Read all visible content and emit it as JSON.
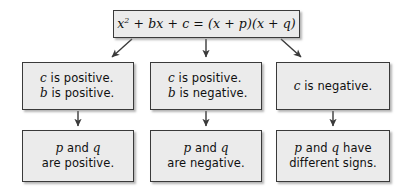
{
  "diagram": {
    "background_color": "#ffffff",
    "box_fill": "#ebebeb",
    "box_border_color": "#3a3a3a",
    "text_color": "#101010",
    "connector_color": "#3a3a3a"
  },
  "equation": {
    "lhs_x": "x",
    "lhs_exponent": "2",
    "lhs_rest": " + bx + c = (x + p)(x + q)",
    "full_text": "x2 + bx + c = (x + p)(x + q)"
  },
  "conditions": [
    {
      "id": "left",
      "line1_var": "c",
      "line1_text": " is positive.",
      "line2_var": "b",
      "line2_text": " is positive.",
      "full_text": "c is positive. b is positive."
    },
    {
      "id": "middle",
      "line1_var": "c",
      "line1_text": " is positive.",
      "line2_var": "b",
      "line2_text": " is negative.",
      "full_text": "c is positive. b is negative."
    },
    {
      "id": "right",
      "line1_var": "c",
      "line1_text": " is negative.",
      "full_text": "c is negative."
    }
  ],
  "conclusions": [
    {
      "id": "left",
      "line1_var1": "p",
      "line1_mid": " and ",
      "line1_var2": "q",
      "line1_tail": "",
      "line2_text": "are positive.",
      "full_text": "p and q are positive."
    },
    {
      "id": "middle",
      "line1_var1": "p",
      "line1_mid": " and ",
      "line1_var2": "q",
      "line1_tail": "",
      "line2_text": "are negative.",
      "full_text": "p and q are negative."
    },
    {
      "id": "right",
      "line1_var1": "p",
      "line1_mid": " and ",
      "line1_var2": "q",
      "line1_tail": " have",
      "line2_text": "different signs.",
      "full_text": "p and q have different signs."
    }
  ],
  "connectors": [
    {
      "id": "equation-to-left",
      "style": "diagonal-left",
      "from": "equation",
      "to": "condition-left"
    },
    {
      "id": "equation-to-middle",
      "style": "vertical",
      "from": "equation",
      "to": "condition-middle"
    },
    {
      "id": "equation-to-right",
      "style": "diagonal-right",
      "from": "equation",
      "to": "condition-right"
    },
    {
      "id": "left-condition-to-conclusion",
      "style": "vertical",
      "from": "condition-left",
      "to": "conclusion-left"
    },
    {
      "id": "middle-condition-to-conclusion",
      "style": "vertical",
      "from": "condition-middle",
      "to": "conclusion-middle"
    },
    {
      "id": "right-condition-to-conclusion",
      "style": "vertical",
      "from": "condition-right",
      "to": "conclusion-right"
    }
  ]
}
